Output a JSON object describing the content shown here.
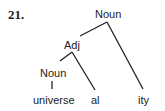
{
  "figure": {
    "number": "21.",
    "nodes": {
      "root": "Noun",
      "adj": "Adj",
      "inner_noun": "Noun"
    },
    "leaves": [
      "universe",
      "al",
      "ity"
    ]
  }
}
